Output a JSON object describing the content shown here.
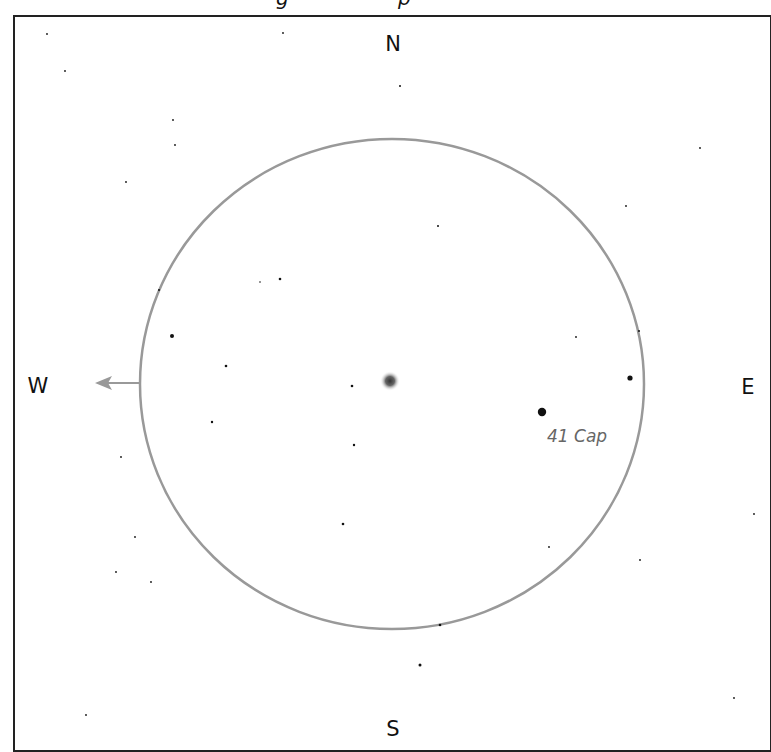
{
  "title": {
    "visible_fragments": [
      "g",
      "p"
    ]
  },
  "compass": {
    "north": "N",
    "south": "S",
    "east": "E",
    "west": "W"
  },
  "colors": {
    "frame": "#222222",
    "field_circle": "#999999",
    "arrow": "#999999",
    "label": "#666666",
    "star": "#111111"
  },
  "field_of_view": {
    "cx": 392,
    "cy": 384,
    "rx": 252,
    "ry": 245
  },
  "drift_arrow": {
    "from": [
      141,
      383
    ],
    "to": [
      95,
      383
    ],
    "direction": "west"
  },
  "target_object": {
    "x": 390,
    "y": 381,
    "type": "fuzzy-object"
  },
  "labels": [
    {
      "text": "41 Cap",
      "x": 548,
      "y": 427
    }
  ],
  "stars": [
    {
      "x": 47,
      "y": 34,
      "r": 0.9
    },
    {
      "x": 283,
      "y": 33,
      "r": 0.9
    },
    {
      "x": 65,
      "y": 71,
      "r": 0.9
    },
    {
      "x": 400,
      "y": 86,
      "r": 1
    },
    {
      "x": 173,
      "y": 120,
      "r": 0.9
    },
    {
      "x": 175,
      "y": 145,
      "r": 0.9
    },
    {
      "x": 700,
      "y": 148,
      "r": 0.9
    },
    {
      "x": 126,
      "y": 182,
      "r": 0.9
    },
    {
      "x": 626,
      "y": 206,
      "r": 0.9
    },
    {
      "x": 438,
      "y": 226,
      "r": 1
    },
    {
      "x": 260,
      "y": 282,
      "r": 0.8
    },
    {
      "x": 280,
      "y": 279,
      "r": 1.3
    },
    {
      "x": 159,
      "y": 290,
      "r": 1
    },
    {
      "x": 172,
      "y": 336,
      "r": 2
    },
    {
      "x": 576,
      "y": 337,
      "r": 0.9
    },
    {
      "x": 639,
      "y": 331,
      "r": 1
    },
    {
      "x": 226,
      "y": 366,
      "r": 1.3
    },
    {
      "x": 630,
      "y": 378,
      "r": 2.6
    },
    {
      "x": 352,
      "y": 386,
      "r": 1.3
    },
    {
      "x": 542,
      "y": 412,
      "r": 4.2
    },
    {
      "x": 212,
      "y": 422,
      "r": 1.2
    },
    {
      "x": 354,
      "y": 445,
      "r": 1.2
    },
    {
      "x": 121,
      "y": 457,
      "r": 0.9
    },
    {
      "x": 754,
      "y": 514,
      "r": 0.9
    },
    {
      "x": 343,
      "y": 524,
      "r": 1.3
    },
    {
      "x": 135,
      "y": 537,
      "r": 0.9
    },
    {
      "x": 549,
      "y": 547,
      "r": 0.9
    },
    {
      "x": 640,
      "y": 560,
      "r": 0.9
    },
    {
      "x": 116,
      "y": 572,
      "r": 0.9
    },
    {
      "x": 151,
      "y": 582,
      "r": 0.9
    },
    {
      "x": 440,
      "y": 625,
      "r": 1.3
    },
    {
      "x": 420,
      "y": 665,
      "r": 1.5
    },
    {
      "x": 734,
      "y": 698,
      "r": 0.9
    },
    {
      "x": 86,
      "y": 715,
      "r": 0.9
    }
  ]
}
